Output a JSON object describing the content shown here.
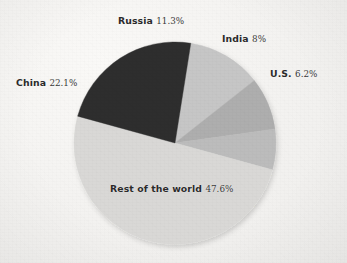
{
  "figure": {
    "background_color": "#f3f2f0",
    "pie": {
      "center_x": 175,
      "center_y": 143,
      "radius": 101,
      "start_angle_deg": -81
    }
  },
  "chart_data": {
    "type": "pie",
    "title": "",
    "subtitle": "",
    "xlabel": "",
    "ylabel": "",
    "legend_position": "none",
    "labels_position": "outside-callout",
    "units": "percent",
    "total": 95.2,
    "categories": [
      "Russia",
      "India",
      "U.S.",
      "Rest of the world",
      "China"
    ],
    "values": [
      11.3,
      8,
      6.2,
      47.6,
      22.1
    ],
    "value_labels": [
      "11.3%",
      "8%",
      "6.2%",
      "47.6%",
      "22.1%"
    ],
    "colors": [
      "#c6c6c6",
      "#aeaeae",
      "#bcbcbc",
      "#d9d8d6",
      "#2f2f2f"
    ],
    "slices": [
      {
        "name": "Russia",
        "value": 11.3,
        "value_label": "11.3%",
        "color": "#c6c6c6"
      },
      {
        "name": "India",
        "value": 8,
        "value_label": "8%",
        "color": "#aeaeae"
      },
      {
        "name": "U.S.",
        "value": 6.2,
        "value_label": "6.2%",
        "color": "#bcbcbc"
      },
      {
        "name": "Rest of the world",
        "value": 47.6,
        "value_label": "47.6%",
        "color": "#d9d8d6"
      },
      {
        "name": "China",
        "value": 22.1,
        "value_label": "22.1%",
        "color": "#2f2f2f"
      }
    ]
  },
  "labels": {
    "russia": {
      "name": "Russia",
      "pct": "11.3%"
    },
    "india": {
      "name": "India",
      "pct": "8%"
    },
    "us": {
      "name": "U.S.",
      "pct": "6.2%"
    },
    "china": {
      "name": "China",
      "pct": "22.1%"
    },
    "rest": {
      "name": "Rest of the world",
      "pct": "47.6%"
    }
  }
}
